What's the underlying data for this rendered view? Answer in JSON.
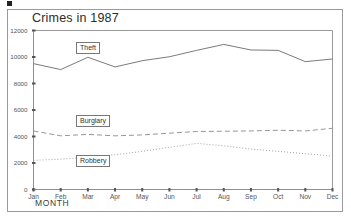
{
  "chart_data": {
    "type": "line",
    "title": "Crimes in 1987",
    "xlabel": "MONTH",
    "ylabel": "",
    "categories": [
      "Jan",
      "Feb",
      "Mar",
      "Apr",
      "May",
      "Jun",
      "Jul",
      "Aug",
      "Sep",
      "Oct",
      "Nov",
      "Dec"
    ],
    "ylim": [
      0,
      12000
    ],
    "yticks": [
      0,
      2000,
      4000,
      6000,
      8000,
      10000,
      12000
    ],
    "ytick_labels": [
      "0",
      "2000",
      "4000",
      "6000",
      "8000",
      "10000",
      "12000"
    ],
    "grid": false,
    "legend_position": "inline-labels",
    "series": [
      {
        "name": "Theft",
        "style": "solid",
        "color": "#6b6b6b",
        "values": [
          9500,
          9050,
          9980,
          9250,
          9720,
          10020,
          10500,
          10950,
          10530,
          10500,
          9650,
          9850
        ]
      },
      {
        "name": "Burglary",
        "style": "dashed",
        "color": "#8a8a8a",
        "values": [
          4420,
          4050,
          4160,
          4050,
          4120,
          4250,
          4380,
          4400,
          4420,
          4470,
          4420,
          4620
        ]
      },
      {
        "name": "Robbery",
        "style": "dotted",
        "color": "#9a9a9a",
        "values": [
          2200,
          2290,
          2430,
          2620,
          2880,
          3180,
          3480,
          3300,
          3050,
          2880,
          2700,
          2520
        ]
      }
    ]
  },
  "frame": {
    "border_color": "#9a9a9a",
    "background": "#ffffff"
  }
}
